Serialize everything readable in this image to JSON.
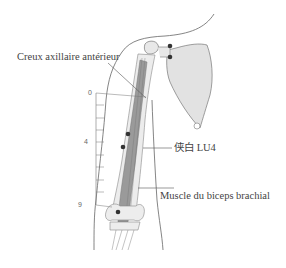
{
  "diagram": {
    "labels": {
      "axilla": "Creux axillaire antérieur",
      "point": "侠白 LU4",
      "muscle": "Muscle du biceps brachial"
    },
    "scale": {
      "ticks": [
        "0",
        "4",
        "9"
      ],
      "divisions": 9
    },
    "points": [
      {
        "name": "shoulder-point-upper",
        "x": 170,
        "y": 46
      },
      {
        "name": "shoulder-point-lower",
        "x": 170,
        "y": 57
      },
      {
        "name": "arm-point-upper",
        "x": 128,
        "y": 134
      },
      {
        "name": "lu4-point",
        "x": 123,
        "y": 147
      },
      {
        "name": "elbow-point",
        "x": 118,
        "y": 212
      }
    ],
    "colors": {
      "line": "#555555",
      "bone_fill": "#e2e2e2",
      "muscle_fill": "#9a9a9a",
      "point": "#333333",
      "text": "#444444"
    }
  }
}
